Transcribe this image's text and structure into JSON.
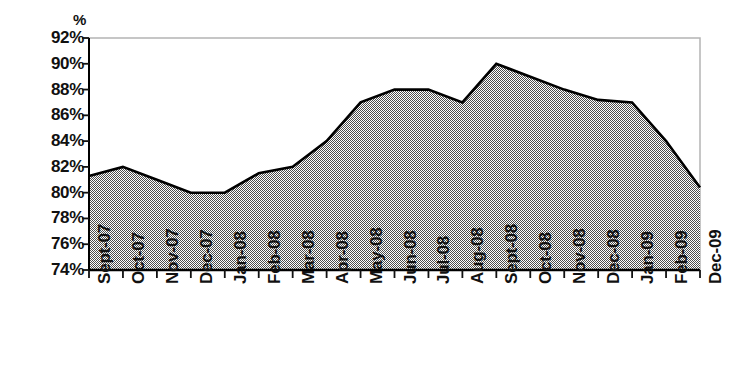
{
  "chart_data": {
    "type": "area",
    "title": "",
    "subtitle": "",
    "xlabel": "",
    "ylabel": "%",
    "yunit_caption": "%",
    "ylim": [
      74,
      92
    ],
    "ytick_step": 2,
    "ytick_labels": [
      "92%",
      "90%",
      "88%",
      "86%",
      "84%",
      "82%",
      "80%",
      "78%",
      "76%",
      "74%"
    ],
    "ytick_values": [
      92,
      90,
      88,
      86,
      84,
      82,
      80,
      78,
      76,
      74
    ],
    "grid": false,
    "legend": "none",
    "categories": [
      "Sept-07",
      "Oct-07",
      "Nov-07",
      "Dec-07",
      "Jan-08",
      "Feb-08",
      "Mar-08",
      "Apr-08",
      "May-08",
      "Jun-08",
      "Jul-08",
      "Aug-08",
      "Sept-08",
      "Oct-08",
      "Nov-08",
      "Dec-08",
      "Jan-09",
      "Feb-09",
      "Dec-09"
    ],
    "values": [
      81.3,
      82.0,
      81.0,
      80.0,
      80.0,
      81.5,
      82.0,
      84.0,
      87.0,
      88.0,
      88.0,
      87.0,
      90.0,
      89.0,
      88.0,
      87.2,
      87.0,
      84.0,
      80.4
    ],
    "colors": {
      "area_fill": "#808080",
      "line": "#000000",
      "axis": "#000000",
      "frame": "#b4b4b4",
      "text": "#111111",
      "background": "#ffffff"
    }
  }
}
